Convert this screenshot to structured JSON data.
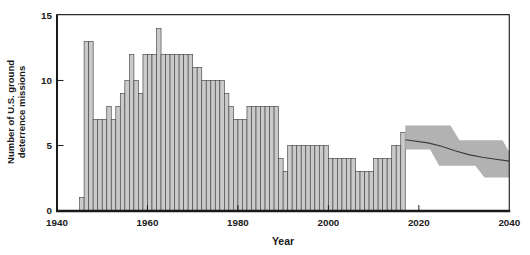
{
  "chart_data": {
    "type": "bar",
    "title": "",
    "xlabel": "Year",
    "ylabel": "Number of U.S. ground deterrence missions",
    "ylabel_lines": [
      "Number of U.S. ground",
      "deterrence missions"
    ],
    "xlim": [
      1940,
      2040
    ],
    "ylim": [
      0,
      15
    ],
    "x_ticks": [
      1940,
      1960,
      1980,
      2000,
      2020,
      2040
    ],
    "x_ticks_marked": [
      1960,
      1980,
      2000,
      2020
    ],
    "y_ticks": [
      0,
      5,
      10,
      15
    ],
    "y_ticks_marked": [
      5,
      10
    ],
    "grid": false,
    "legend": "none",
    "bars": {
      "start_year": 1945,
      "end_year": 2016,
      "values": [
        1,
        13,
        13,
        7,
        7,
        7,
        8,
        7,
        8,
        9,
        10,
        12,
        10,
        9,
        12,
        12,
        12,
        14,
        12,
        12,
        12,
        12,
        12,
        12,
        12,
        11,
        11,
        10,
        10,
        10,
        10,
        10,
        9,
        8,
        7,
        7,
        7,
        8,
        8,
        8,
        8,
        8,
        8,
        8,
        4,
        3,
        5,
        5,
        5,
        5,
        5,
        5,
        5,
        5,
        5,
        4,
        4,
        4,
        4,
        4,
        4,
        3,
        3,
        3,
        3,
        4,
        4,
        4,
        4,
        5,
        5,
        6
      ]
    },
    "projection_band": {
      "description": "shaded uncertainty band 2017-2040",
      "top": [
        [
          2017,
          6.55
        ],
        [
          2027,
          6.55
        ],
        [
          2029,
          5.4
        ],
        [
          2038.5,
          5.4
        ],
        [
          2040,
          4.5
        ]
      ],
      "bottom": [
        [
          2017,
          4.7
        ],
        [
          2022.5,
          4.7
        ],
        [
          2024.5,
          3.45
        ],
        [
          2032.5,
          3.45
        ],
        [
          2034.5,
          2.55
        ],
        [
          2040,
          2.55
        ]
      ]
    },
    "projection_line": [
      [
        2017,
        5.45
      ],
      [
        2022,
        5.2
      ],
      [
        2025,
        4.95
      ],
      [
        2028,
        4.6
      ],
      [
        2031,
        4.3
      ],
      [
        2034,
        4.1
      ],
      [
        2037,
        3.95
      ],
      [
        2040,
        3.8
      ]
    ],
    "colors": {
      "bar_fill": "#cacaca",
      "bar_edge": "#4d4d4d",
      "band_fill": "#b2b2b2",
      "projection_line": "#3a3a3a",
      "axis": "#1a1a1a",
      "background": "#ffffff"
    }
  }
}
